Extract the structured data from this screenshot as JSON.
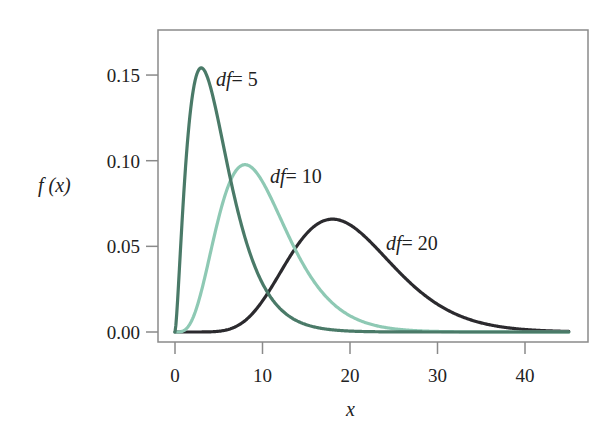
{
  "chart_data": {
    "type": "line",
    "title": "",
    "xlabel": "x",
    "ylabel": "f (x)",
    "xlim": [
      -2,
      47
    ],
    "ylim": [
      -0.005,
      0.165
    ],
    "x_ticks": [
      0,
      10,
      20,
      30,
      40
    ],
    "x_tick_labels": [
      "0",
      "10",
      "20",
      "30",
      "40"
    ],
    "y_ticks": [
      0.0,
      0.05,
      0.1,
      0.15
    ],
    "y_tick_labels": [
      "0.00",
      "0.05",
      "0.10",
      "0.15"
    ],
    "grid": false,
    "legend": "inline labels",
    "x_range_plotted": [
      0,
      45
    ],
    "series": [
      {
        "name": "df = 5",
        "df": 5,
        "color": "#4a7a68",
        "label_var": "df",
        "label_value": "= 5",
        "peak": {
          "x": 3,
          "y": 0.154
        },
        "x": [
          0,
          1,
          2,
          3,
          4,
          5,
          6,
          8,
          10,
          12,
          15,
          20,
          25,
          30,
          45
        ],
        "values": [
          0,
          0.08,
          0.138,
          0.154,
          0.144,
          0.122,
          0.097,
          0.055,
          0.028,
          0.013,
          0.004,
          0.0004,
          3e-05,
          0.0,
          0.0
        ]
      },
      {
        "name": "df = 10",
        "df": 10,
        "color": "#8ec9b4",
        "label_var": "df",
        "label_value": "= 10",
        "peak": {
          "x": 8,
          "y": 0.098
        },
        "x": [
          0,
          2,
          4,
          6,
          8,
          10,
          12,
          14,
          16,
          18,
          20,
          25,
          30,
          35,
          45
        ],
        "values": [
          0,
          0.015,
          0.058,
          0.09,
          0.098,
          0.088,
          0.069,
          0.049,
          0.032,
          0.02,
          0.012,
          0.003,
          0.0006,
          0.0001,
          0.0
        ]
      },
      {
        "name": "df = 20",
        "df": 20,
        "color": "#2b2a2e",
        "label_var": "df",
        "label_value": "= 20",
        "peak": {
          "x": 18,
          "y": 0.066
        },
        "x": [
          0,
          4,
          8,
          10,
          12,
          14,
          16,
          18,
          20,
          22,
          24,
          26,
          28,
          30,
          35,
          40,
          45
        ],
        "values": [
          0,
          0.0001,
          0.004,
          0.013,
          0.028,
          0.044,
          0.058,
          0.066,
          0.063,
          0.055,
          0.044,
          0.032,
          0.022,
          0.014,
          0.004,
          0.001,
          0.0
        ]
      }
    ]
  },
  "frame": {
    "color": "#888888"
  }
}
